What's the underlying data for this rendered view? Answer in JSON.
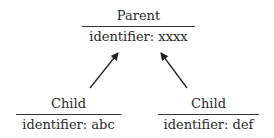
{
  "diagram": {
    "parent": {
      "title": "Parent",
      "identifier": "identifier: xxxx"
    },
    "children": [
      {
        "title": "Child",
        "identifier": "identifier: abc"
      },
      {
        "title": "Child",
        "identifier": "identifier: def"
      }
    ],
    "edges": [
      {
        "from": "children.0",
        "to": "parent",
        "style": "arrow"
      },
      {
        "from": "children.1",
        "to": "parent",
        "style": "arrow"
      }
    ],
    "colors": {
      "line": "#333333",
      "text": "#2a2a2a",
      "background": "#ffffff"
    }
  }
}
